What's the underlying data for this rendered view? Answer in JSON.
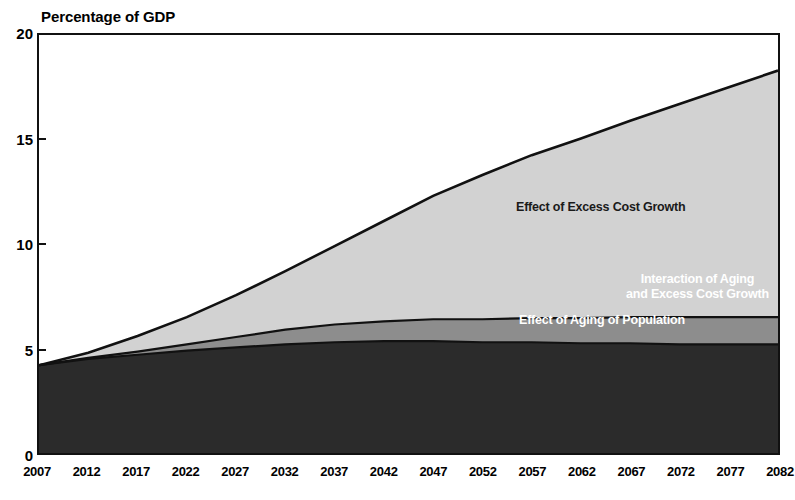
{
  "figure": {
    "axis_title": "Percentage of GDP"
  },
  "labels": {
    "excess": "Effect of Excess Cost Growth",
    "interaction_line1": "Interaction of Aging",
    "interaction_line2": "and Excess Cost Growth",
    "aging": "Effect of Aging of Population"
  },
  "colors": {
    "excess_cost_growth": "#d2d2d2",
    "interaction": "#8d8d8d",
    "aging": "#2b2b2b",
    "outline": "#111111",
    "background": "#ffffff"
  },
  "chart_data": {
    "type": "area",
    "title": "Percentage of GDP",
    "xlabel": "",
    "ylabel": "Percentage of GDP",
    "stacked": true,
    "grid": false,
    "legend_position": "inside-plot-annotations",
    "xlim": [
      2007,
      2082
    ],
    "ylim": [
      0,
      20
    ],
    "yticks": [
      0,
      5,
      10,
      15,
      20
    ],
    "xticks": [
      2007,
      2012,
      2017,
      2022,
      2027,
      2032,
      2037,
      2042,
      2047,
      2052,
      2057,
      2062,
      2067,
      2072,
      2077,
      2082
    ],
    "x": [
      2007,
      2012,
      2017,
      2022,
      2027,
      2032,
      2037,
      2042,
      2047,
      2052,
      2057,
      2062,
      2067,
      2072,
      2077,
      2082
    ],
    "series": [
      {
        "name": "Effect of Aging of Population",
        "color": "#2b2b2b",
        "values": [
          4.2,
          4.5,
          4.7,
          4.9,
          5.05,
          5.2,
          5.3,
          5.35,
          5.35,
          5.3,
          5.3,
          5.25,
          5.25,
          5.2,
          5.2,
          5.2
        ]
      },
      {
        "name": "Interaction of Aging and Excess Cost Growth",
        "color": "#8d8d8d",
        "values": [
          0.0,
          0.05,
          0.15,
          0.3,
          0.5,
          0.7,
          0.85,
          0.95,
          1.05,
          1.1,
          1.15,
          1.2,
          1.25,
          1.3,
          1.3,
          1.3
        ]
      },
      {
        "name": "Effect of Excess Cost Growth",
        "color": "#d2d2d2",
        "values": [
          0.0,
          0.25,
          0.75,
          1.3,
          2.0,
          2.8,
          3.75,
          4.8,
          5.9,
          6.9,
          7.8,
          8.6,
          9.4,
          10.2,
          11.0,
          11.8
        ]
      }
    ],
    "cumulative_totals": [
      4.2,
      4.8,
      5.6,
      6.5,
      7.55,
      8.7,
      9.9,
      11.1,
      12.3,
      13.3,
      14.25,
      15.05,
      15.9,
      16.7,
      17.5,
      18.3
    ],
    "annotations": [
      {
        "text": "Effect of Excess Cost Growth",
        "at": [
          2057,
          11.5
        ]
      },
      {
        "text": "Interaction of Aging and Excess Cost Growth",
        "at": [
          2070,
          8.0
        ]
      },
      {
        "text": "Effect of Aging of Population",
        "at": [
          2060,
          5.9
        ]
      }
    ]
  }
}
